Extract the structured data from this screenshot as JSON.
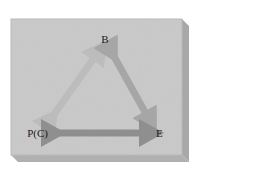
{
  "figure": {
    "name": "triangular-relationship-diagram",
    "caption": "",
    "canvas": {
      "width": 279,
      "height": 185,
      "background": "#ffffff"
    },
    "panel": {
      "face_color": "#c9c9c9",
      "side_color": "#a8a8a8",
      "bottom_color": "#b0b0b0",
      "top_highlight": "#d6d6d6",
      "x": 11,
      "y": 19,
      "width": 171,
      "height": 136,
      "depth": 7
    },
    "nodes": [
      {
        "id": "B",
        "label": "B",
        "x": 105,
        "y": 40,
        "anchor": "middle"
      },
      {
        "id": "PC",
        "label": "P(C)",
        "x": 48,
        "y": 134,
        "anchor": "end"
      },
      {
        "id": "E",
        "label": "E",
        "x": 156,
        "y": 134,
        "anchor": "start"
      }
    ],
    "edges": [
      {
        "id": "pc-b",
        "from": "PC",
        "to": "B",
        "double_headed": true,
        "color": "#bcbcbc",
        "width": 7,
        "x1": 50,
        "y1": 120,
        "x2": 99,
        "y2": 51
      },
      {
        "id": "b-e",
        "from": "B",
        "to": "E",
        "double_headed": true,
        "color": "#a6a6a6",
        "width": 7,
        "x1": 111,
        "y1": 51,
        "x2": 150,
        "y2": 121
      },
      {
        "id": "pc-e",
        "from": "PC",
        "to": "E",
        "double_headed": true,
        "color": "#8f8f8f",
        "width": 7,
        "x1": 52,
        "y1": 133,
        "x2": 150,
        "y2": 133
      }
    ]
  }
}
